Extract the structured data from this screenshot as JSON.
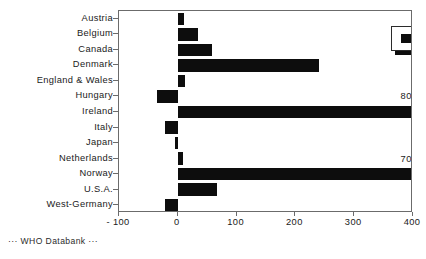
{
  "footer": {
    "source_note": "··· WHO Databank ···"
  },
  "legend": {
    "entries": [
      {
        "label": "15 - 19  year",
        "color": "#0d0d0d",
        "swatch": "filled-square-swatch"
      }
    ]
  },
  "chart_data": {
    "type": "bar",
    "orientation": "horizontal",
    "title": "",
    "subtitle": "",
    "xlabel": "",
    "ylabel": "",
    "xlim": [
      -100,
      400
    ],
    "xticks": [
      -100,
      0,
      100,
      200,
      300,
      400
    ],
    "xticklabels": [
      "- 100",
      "0",
      "100",
      "200",
      "300",
      "400"
    ],
    "grid": false,
    "legend_position": "top-right",
    "categories": [
      "Austria",
      "Belgium",
      "Canada",
      "Denmark",
      "England & Wales",
      "Hungary",
      "Ireland",
      "Italy",
      "Japan",
      "Netherlands",
      "Norway",
      "U.S.A.",
      "West-Germany"
    ],
    "series": [
      {
        "name": "15 - 19  year",
        "color": "#0d0d0d",
        "values": [
          10,
          34,
          58,
          240,
          13,
          -36,
          800,
          -22,
          -5,
          8,
          708,
          66,
          -22
        ]
      }
    ],
    "annotations": [
      {
        "text": "800 %",
        "category": "Hungary",
        "value": 360,
        "note": "Ireland bar clipped at axis maximum"
      },
      {
        "text": "708 %",
        "category": "Netherlands",
        "value": 360,
        "note": "Norway bar clipped at axis maximum"
      }
    ],
    "clipped_categories": [
      "Ireland",
      "Norway"
    ]
  }
}
